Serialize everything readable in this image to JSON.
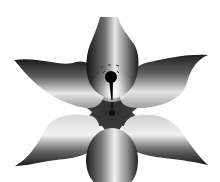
{
  "image": {
    "subject": "six-petal grayscale flower",
    "background_color": "#ffffff",
    "petal_count": 6,
    "colors": {
      "petal_dark": "#1a1a1a",
      "petal_mid": "#7a7a7a",
      "petal_light": "#f0f0f0",
      "hub": "#3a3a3a",
      "pistil": "#000000"
    }
  }
}
